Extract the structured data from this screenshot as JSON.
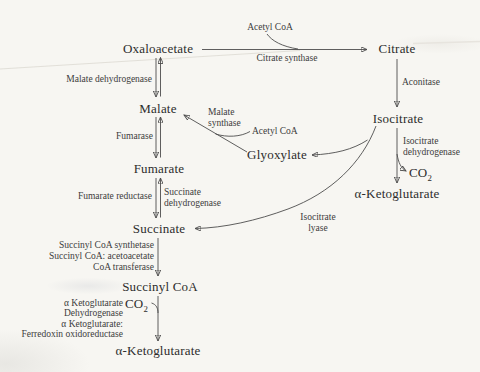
{
  "colors": {
    "background": "#f7f6f2",
    "line": "#4d4d4d",
    "metabolite_text": "#2c2c2c",
    "enzyme_text": "#3c3c3c"
  },
  "metabolites": {
    "oxaloacetate": "Oxaloacetate",
    "citrate": "Citrate",
    "malate": "Malate",
    "isocitrate": "Isocitrate",
    "fumarate": "Fumarate",
    "glyoxylate": "Glyoxylate",
    "alpha_ketoglutarate_right": "α-Ketoglutarate",
    "succinate": "Succinate",
    "succinyl_coa": "Succinyl CoA",
    "alpha_ketoglutarate_bottom": "α-Ketoglutarate"
  },
  "cofactors": {
    "acetyl_coa_top": "Acetyl CoA",
    "acetyl_coa_mid": "Acetyl CoA",
    "co2_right": {
      "base": "CO",
      "sub": "2"
    },
    "co2_bottom": {
      "base": "CO",
      "sub": "2"
    }
  },
  "enzymes": {
    "citrate_synthase": "Citrate synthase",
    "aconitase": "Aconitase",
    "malate_dehydrogenase": "Malate dehydrogenase",
    "fumarase": "Fumarase",
    "malate_synthase_line1": "Malate",
    "malate_synthase_line2": "synthase",
    "isocitrate_dehydrogenase_line1": "Isocitrate",
    "isocitrate_dehydrogenase_line2": "dehydrogenase",
    "fumarate_reductase": "Fumarate reductase",
    "succinate_dehydrogenase_line1": "Succinate",
    "succinate_dehydrogenase_line2": "dehydrogenase",
    "isocitrate_lyase_line1": "Isocitrate",
    "isocitrate_lyase_line2": "lyase",
    "succinyl_coa_synthetase": "Succinyl CoA synthetase",
    "succinyl_coa_acetoacetate": "Succinyl CoA: acetoacetate",
    "coa_transferase": "CoA transferase",
    "akg_dehydrogenase_line1": "α Ketoglutarate",
    "akg_dehydrogenase_line2": "Dehydrogenase",
    "akg_ferredoxin_line1": "α Ketoglutarate:",
    "akg_ferredoxin_line2": "Ferredoxin oxidoreductase"
  }
}
